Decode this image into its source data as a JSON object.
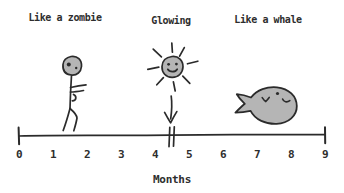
{
  "figure": {
    "background_color": "#ffffff",
    "ink_color": "#2b2b2b",
    "shape_fill_color": "#b5b5b5"
  },
  "annotations": [
    {
      "label": "Like a zombie",
      "icon": "zombie-stick-figure",
      "months_position": 1.5
    },
    {
      "label": "Glowing",
      "icon": "smiling-sun-with-arrow",
      "months_position": 4.5
    },
    {
      "label": "Like a whale",
      "icon": "whale",
      "months_position": 7.3
    }
  ],
  "axis": {
    "label": "Months",
    "min": 0,
    "max": 9,
    "tick_labels": [
      "0",
      "1",
      "2",
      "3",
      "4",
      "5",
      "6",
      "7",
      "8",
      "9"
    ],
    "break_marker_position": 4.5
  }
}
